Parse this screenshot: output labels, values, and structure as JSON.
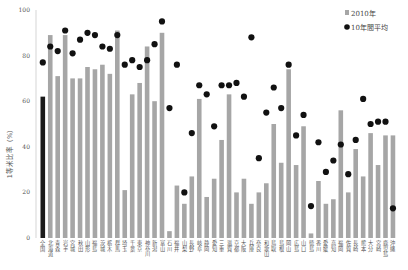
{
  "chart_data": {
    "type": "bar",
    "title": "",
    "xlabel": "",
    "ylabel": "1等米比率（%）",
    "ylim": [
      0,
      100
    ],
    "yticks": [
      0,
      20,
      40,
      60,
      80,
      100
    ],
    "grid": false,
    "legend_position": "top-right",
    "categories": [
      "全国",
      "北海道",
      "青森",
      "岩手",
      "宮城",
      "秋田",
      "山形",
      "福島",
      "茨城",
      "栃木",
      "群馬",
      "埼玉",
      "千葉",
      "東京",
      "神奈川",
      "新潟",
      "富山",
      "石川",
      "福井",
      "山梨",
      "長野",
      "岐阜",
      "静岡",
      "愛知",
      "三重",
      "滋賀",
      "京都",
      "大阪",
      "兵庫",
      "奈良",
      "和歌山",
      "鳥取",
      "島根",
      "岡山",
      "広島",
      "山口",
      "徳島",
      "香川",
      "愛媛",
      "高知",
      "福岡",
      "佐賀",
      "長崎",
      "熊本",
      "大分",
      "宮崎",
      "鹿児島",
      "沖縄"
    ],
    "series": [
      {
        "name": "2010年",
        "kind": "bar",
        "color": "#a6a6a6",
        "highlight_color": "#1a1a1a",
        "values": [
          62,
          89,
          71,
          89,
          70,
          70,
          75,
          74,
          76,
          72,
          91,
          21,
          63,
          68,
          84,
          60,
          90,
          3,
          23,
          15,
          27,
          61,
          18,
          26,
          43,
          63,
          20,
          26,
          15,
          20,
          24,
          50,
          33,
          74,
          32,
          49,
          2,
          25,
          15,
          17,
          56,
          20,
          39,
          27,
          46,
          32,
          45,
          45
        ]
      },
      {
        "name": "10年間平均",
        "kind": "dot",
        "color": "#111111",
        "values": [
          77,
          84,
          82,
          91,
          81,
          87,
          90,
          89,
          84,
          83,
          89,
          76,
          78,
          75,
          78,
          85,
          95,
          57,
          76,
          20,
          46,
          67,
          63,
          49,
          67,
          67,
          68,
          62,
          88,
          35,
          55,
          66,
          57,
          76,
          45,
          54,
          14,
          42,
          29,
          34,
          41,
          28,
          43,
          61,
          50,
          51,
          51,
          13
        ]
      }
    ]
  },
  "legend": {
    "items": [
      {
        "label": "2010年",
        "marker": "square",
        "color": "#a6a6a6"
      },
      {
        "label": "10年間平均",
        "marker": "circle",
        "color": "#111111"
      }
    ]
  }
}
